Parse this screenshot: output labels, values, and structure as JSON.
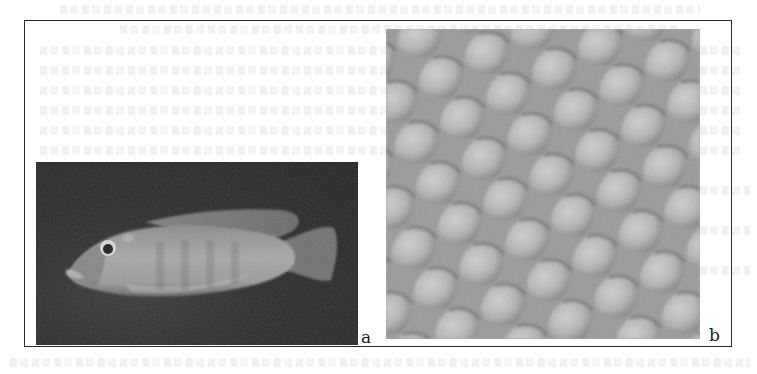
{
  "figure": {
    "panels": [
      {
        "id": "a",
        "label": "a",
        "content": "photograph of a cichlid fish, lateral view, facing left, on dark background"
      },
      {
        "id": "b",
        "label": "b",
        "content": "close-up texture of overlapping fish scales in grayscale"
      }
    ]
  },
  "colors": {
    "frame": "#2a2a2a",
    "panel_a_background": "#262626",
    "fish_body": "#9a9a9a",
    "scale_base": "#a9a9a9",
    "scale_edge": "#6e6e6e",
    "scale_highlight": "#cfcfcf"
  }
}
